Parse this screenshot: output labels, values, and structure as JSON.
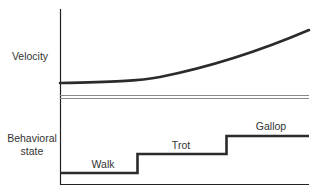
{
  "diagram": {
    "panels": [
      {
        "id": "velocity",
        "y_label": "Velocity",
        "curve_description": "Velocity flat at first, then rising smoothly and increasingly toward the right"
      },
      {
        "id": "behavioral-state",
        "y_label_lines": [
          "Behavioral",
          "state"
        ],
        "states": [
          {
            "label": "Walk",
            "level": 1
          },
          {
            "label": "Trot",
            "level": 2
          },
          {
            "label": "Gallop",
            "level": 3
          }
        ],
        "description": "Step function: discrete jumps Walk -> Trot -> Gallop as velocity increases continuously"
      }
    ],
    "colors": {
      "line": "#2b2b2b",
      "axis": "#222222",
      "separator": "#888888",
      "text": "#333333"
    }
  },
  "labels": {
    "velocity": "Velocity",
    "behavioral_line1": "Behavioral",
    "behavioral_line2": "state",
    "walk": "Walk",
    "trot": "Trot",
    "gallop": "Gallop"
  }
}
